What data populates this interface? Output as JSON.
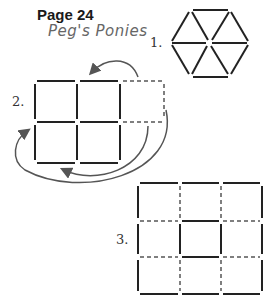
{
  "header": {
    "page_label": "Page 24",
    "subtitle": "Peg's Ponies"
  },
  "puzzles": [
    {
      "label": "1.",
      "shape": "hexagon-of-triangles",
      "description": "Hexagon divided into 6 equilateral triangles by matchsticks"
    },
    {
      "label": "2.",
      "shape": "grid-2x3",
      "description": "2x2 solid square grid with a dashed third column; curved arrows indicate moving sticks",
      "arrows": 3
    },
    {
      "label": "3.",
      "shape": "grid-3x3",
      "description": "3x3 grid with mix of solid and dashed sticks"
    }
  ],
  "colors": {
    "stick": "#222222",
    "dashed": "#555555",
    "arrow": "#555555"
  }
}
